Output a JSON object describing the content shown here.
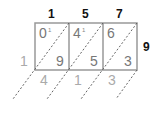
{
  "problem": {
    "multiplicand": "157",
    "multiplier": "9",
    "product": "1413"
  },
  "top_digits": [
    "1",
    "5",
    "7"
  ],
  "right_digit": "9",
  "cells": [
    {
      "tens": "0",
      "ones": "9",
      "carry_mark": "1"
    },
    {
      "tens": "4",
      "ones": "5",
      "carry_mark": "1"
    },
    {
      "tens": "6",
      "ones": "3",
      "carry_mark": ""
    }
  ],
  "result_left": "1",
  "result_bottom": [
    "4",
    "1",
    "3"
  ],
  "colors": {
    "grid": "#999999",
    "diagonal": "#555555",
    "cell_digit": "#777777",
    "result_digit": "#aaaaaa",
    "multiplier_digit": "#111111"
  }
}
